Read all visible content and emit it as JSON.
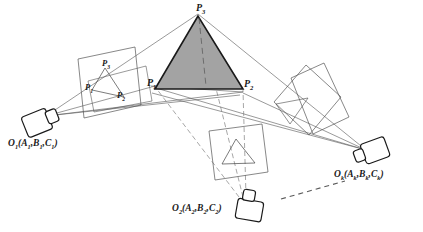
{
  "figure": {
    "colors": {
      "line": "#4a4a4a",
      "outline": "#1a1a1a",
      "target_fill": "#a3a3a3",
      "label": "#1a1a1a",
      "dashed": "#6b6b6b"
    },
    "object_points": [
      {
        "id": "P1",
        "base": "P",
        "sub": "1",
        "x": 151,
        "y": 81,
        "role": "object-point-left-vertex"
      },
      {
        "id": "P2",
        "base": "P",
        "sub": "2",
        "x": 243,
        "y": 81,
        "role": "object-point-right-vertex"
      },
      {
        "id": "P3",
        "base": "P",
        "sub": "3",
        "x": 198,
        "y": 6,
        "role": "object-point-apex"
      }
    ],
    "image_points_left": [
      {
        "id": "p3",
        "base": "P",
        "sub": "3",
        "x": 104,
        "y": 62,
        "role": "image-point-apex-left-plane"
      },
      {
        "id": "p1",
        "base": "P",
        "sub": "1",
        "x": 88,
        "y": 86,
        "role": "image-point-left-vertex-left-plane"
      },
      {
        "id": "p2",
        "base": "P",
        "sub": "2",
        "x": 119,
        "y": 93,
        "role": "image-point-right-vertex-left-plane"
      }
    ],
    "cameras": [
      {
        "id": "O1",
        "base": "O",
        "sub": "1",
        "params": "(A",
        "label_full": "O1(A1,B1,C1)",
        "parts": {
          "o": "O",
          "osub": "1",
          "a": "A",
          "asub": "1",
          "b": "B",
          "bsub": "1",
          "c": "C",
          "csub": "1"
        },
        "label_x": 8,
        "label_y": 139,
        "station": "left-station"
      },
      {
        "id": "O2",
        "base": "O",
        "sub": "2",
        "label_full": "O2(A2,B2,C2)",
        "parts": {
          "o": "O",
          "osub": "2",
          "a": "A",
          "asub": "2",
          "b": "B",
          "bsub": "2",
          "c": "C",
          "csub": "2"
        },
        "label_x": 172,
        "label_y": 204,
        "station": "bottom-station"
      },
      {
        "id": "Ok",
        "base": "O",
        "sub": "k",
        "label_full": "Ok(Ak,Bk,Ck)",
        "parts": {
          "o": "O",
          "osub": "k",
          "a": "A",
          "asub": "k",
          "b": "B",
          "bsub": "k",
          "c": "C",
          "csub": "k"
        },
        "label_x": 334,
        "label_y": 170,
        "station": "right-station"
      }
    ],
    "annotations": {
      "continuation": "dashed-ellipsis-line"
    }
  }
}
